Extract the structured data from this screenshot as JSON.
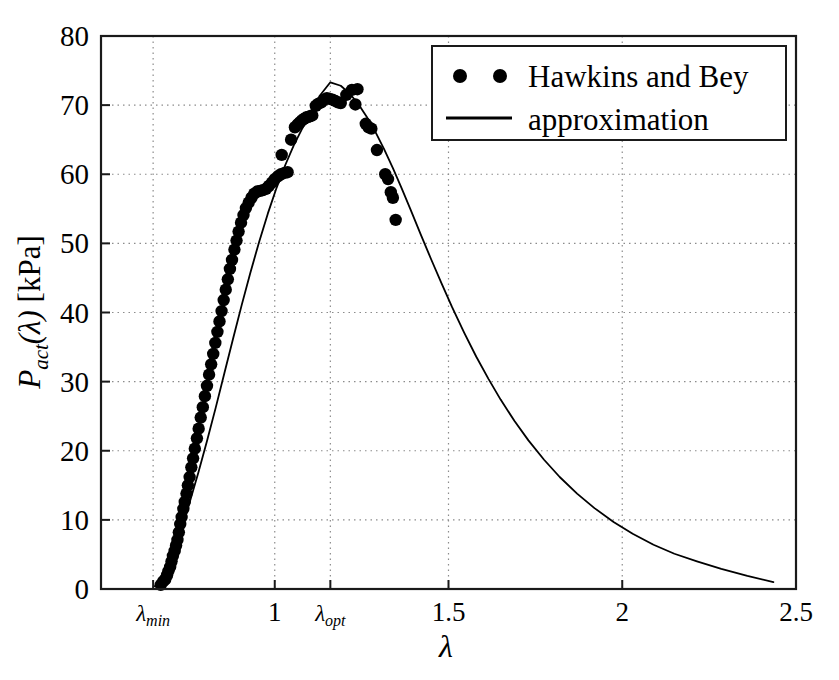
{
  "figure": {
    "background": "#ffffff",
    "frame_color": "#1a1a1a",
    "grid_color": "#8c8c8c",
    "marker_color": "#000000",
    "line_color": "#000000"
  },
  "axes": {
    "ylabel": "P_act(λ) [kPa]",
    "ylabel_parts": {
      "p": "P",
      "sub": "act",
      "arg": "(λ)",
      "unit": "[kPa]"
    },
    "xlabel": "λ"
  },
  "legend": {
    "position": "upper right",
    "entries": [
      {
        "label": "Hawkins and Bey",
        "marker": "dots",
        "style": "scatter"
      },
      {
        "label": "approximation",
        "marker": "line",
        "style": "line"
      }
    ]
  },
  "chart_data": {
    "type": "scatter",
    "title": "",
    "xlabel": "λ",
    "ylabel": "P_act(λ) [kPa]",
    "xlim": [
      0.5,
      2.5
    ],
    "ylim": [
      0,
      80
    ],
    "grid": true,
    "legend_position": "upper right",
    "xticks": [
      0.65,
      1.0,
      1.16,
      1.5,
      2.0,
      2.5
    ],
    "xticklabels": [
      "λ_min",
      "1",
      "λ_opt",
      "1.5",
      "2",
      "2.5"
    ],
    "yticks": [
      0,
      10,
      20,
      30,
      40,
      50,
      60,
      70,
      80
    ],
    "yticklabels": [
      "0",
      "10",
      "20",
      "30",
      "40",
      "50",
      "60",
      "70",
      "80"
    ],
    "series": [
      {
        "name": "Hawkins and Bey",
        "type": "scatter",
        "marker": "o",
        "color": "#000000",
        "points": [
          [
            0.672,
            0.6
          ],
          [
            0.679,
            1.1
          ],
          [
            0.685,
            1.4
          ],
          [
            0.69,
            2.0
          ],
          [
            0.694,
            2.6
          ],
          [
            0.699,
            3.2
          ],
          [
            0.703,
            4.0
          ],
          [
            0.707,
            4.8
          ],
          [
            0.712,
            5.5
          ],
          [
            0.716,
            6.3
          ],
          [
            0.72,
            7.1
          ],
          [
            0.724,
            8.2
          ],
          [
            0.728,
            9.4
          ],
          [
            0.732,
            10.4
          ],
          [
            0.737,
            11.6
          ],
          [
            0.741,
            12.6
          ],
          [
            0.746,
            13.8
          ],
          [
            0.75,
            15.0
          ],
          [
            0.755,
            16.2
          ],
          [
            0.76,
            17.6
          ],
          [
            0.765,
            18.9
          ],
          [
            0.77,
            20.3
          ],
          [
            0.776,
            21.8
          ],
          [
            0.781,
            23.2
          ],
          [
            0.787,
            24.8
          ],
          [
            0.793,
            26.3
          ],
          [
            0.799,
            27.9
          ],
          [
            0.805,
            29.4
          ],
          [
            0.811,
            31.0
          ],
          [
            0.817,
            32.5
          ],
          [
            0.823,
            34.0
          ],
          [
            0.829,
            35.6
          ],
          [
            0.835,
            37.2
          ],
          [
            0.841,
            38.7
          ],
          [
            0.847,
            40.2
          ],
          [
            0.853,
            41.8
          ],
          [
            0.859,
            43.3
          ],
          [
            0.865,
            44.8
          ],
          [
            0.871,
            46.3
          ],
          [
            0.877,
            47.6
          ],
          [
            0.884,
            49.1
          ],
          [
            0.89,
            50.4
          ],
          [
            0.896,
            51.7
          ],
          [
            0.903,
            53.0
          ],
          [
            0.91,
            54.1
          ],
          [
            0.917,
            55.1
          ],
          [
            0.925,
            55.9
          ],
          [
            0.933,
            56.6
          ],
          [
            0.941,
            57.2
          ],
          [
            0.95,
            57.5
          ],
          [
            0.958,
            57.6
          ],
          [
            0.966,
            57.7
          ],
          [
            0.975,
            57.9
          ],
          [
            0.983,
            58.3
          ],
          [
            0.992,
            58.8
          ],
          [
            1.0,
            59.3
          ],
          [
            1.009,
            59.7
          ],
          [
            1.018,
            60.0
          ],
          [
            1.028,
            60.2
          ],
          [
            1.037,
            60.3
          ],
          [
            1.02,
            62.8
          ],
          [
            1.047,
            65.0
          ],
          [
            1.058,
            66.8
          ],
          [
            1.066,
            67.2
          ],
          [
            1.072,
            67.5
          ],
          [
            1.078,
            67.8
          ],
          [
            1.084,
            68.0
          ],
          [
            1.09,
            68.2
          ],
          [
            1.096,
            68.3
          ],
          [
            1.102,
            68.4
          ],
          [
            1.108,
            68.5
          ],
          [
            1.118,
            69.9
          ],
          [
            1.126,
            70.2
          ],
          [
            1.134,
            70.4
          ],
          [
            1.142,
            70.8
          ],
          [
            1.15,
            71.0
          ],
          [
            1.158,
            70.9
          ],
          [
            1.166,
            70.8
          ],
          [
            1.174,
            70.6
          ],
          [
            1.182,
            70.4
          ],
          [
            1.19,
            70.3
          ],
          [
            1.206,
            71.5
          ],
          [
            1.222,
            72.2
          ],
          [
            1.238,
            72.3
          ],
          [
            1.232,
            70.1
          ],
          [
            1.262,
            67.3
          ],
          [
            1.27,
            66.8
          ],
          [
            1.278,
            66.6
          ],
          [
            1.294,
            63.5
          ],
          [
            1.318,
            60.0
          ],
          [
            1.326,
            59.3
          ],
          [
            1.334,
            57.4
          ],
          [
            1.34,
            56.6
          ],
          [
            1.348,
            53.4
          ]
        ]
      },
      {
        "name": "approximation",
        "type": "line",
        "color": "#000000",
        "linewidth": 1.8,
        "x_start": 0.655,
        "x_end": 2.435,
        "peak_x": 1.16,
        "peak_y": 73.3,
        "points": [
          [
            0.655,
            0.4
          ],
          [
            0.68,
            2.4
          ],
          [
            0.705,
            5.2
          ],
          [
            0.73,
            8.6
          ],
          [
            0.755,
            12.5
          ],
          [
            0.78,
            16.8
          ],
          [
            0.805,
            21.4
          ],
          [
            0.83,
            26.2
          ],
          [
            0.855,
            31.2
          ],
          [
            0.88,
            36.2
          ],
          [
            0.905,
            41.1
          ],
          [
            0.93,
            45.8
          ],
          [
            0.955,
            50.2
          ],
          [
            0.98,
            54.3
          ],
          [
            1.005,
            58.0
          ],
          [
            1.03,
            61.3
          ],
          [
            1.055,
            64.2
          ],
          [
            1.08,
            66.7
          ],
          [
            1.105,
            68.9
          ],
          [
            1.13,
            71.4
          ],
          [
            1.16,
            73.3
          ],
          [
            1.19,
            72.8
          ],
          [
            1.215,
            71.7
          ],
          [
            1.24,
            70.2
          ],
          [
            1.265,
            68.3
          ],
          [
            1.29,
            66.1
          ],
          [
            1.315,
            63.6
          ],
          [
            1.34,
            60.9
          ],
          [
            1.365,
            58.0
          ],
          [
            1.39,
            55.0
          ],
          [
            1.42,
            51.3
          ],
          [
            1.45,
            47.7
          ],
          [
            1.48,
            44.2
          ],
          [
            1.51,
            40.8
          ],
          [
            1.545,
            37.1
          ],
          [
            1.58,
            33.6
          ],
          [
            1.615,
            30.4
          ],
          [
            1.65,
            27.4
          ],
          [
            1.69,
            24.3
          ],
          [
            1.73,
            21.5
          ],
          [
            1.775,
            18.7
          ],
          [
            1.82,
            16.2
          ],
          [
            1.87,
            13.8
          ],
          [
            1.92,
            11.7
          ],
          [
            1.975,
            9.7
          ],
          [
            2.03,
            8.0
          ],
          [
            2.09,
            6.4
          ],
          [
            2.15,
            5.1
          ],
          [
            2.215,
            4.0
          ],
          [
            2.285,
            2.9
          ],
          [
            2.36,
            1.9
          ],
          [
            2.435,
            1.0
          ]
        ]
      }
    ]
  }
}
